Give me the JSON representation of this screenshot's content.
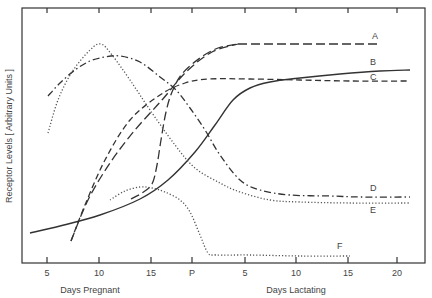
{
  "chart_data": {
    "type": "line",
    "title": "",
    "ylabel": "Receptor  Levels  [ Arbitrary  Units ]",
    "xlabel_segments": [
      {
        "label": "Days  Pregnant",
        "x": 90
      },
      {
        "label": "Days  Lactating",
        "x": 296
      }
    ],
    "x_ticks": [
      {
        "label": "5",
        "px": 47
      },
      {
        "label": "10",
        "px": 99
      },
      {
        "label": "15",
        "px": 151
      },
      {
        "label": "P",
        "px": 192
      },
      {
        "label": "5",
        "px": 245
      },
      {
        "label": "10",
        "px": 296
      },
      {
        "label": "15",
        "px": 348
      },
      {
        "label": "20",
        "px": 397
      }
    ],
    "x_axis_note": "x positions: pregnancy day d -> 47+(d-5)*10.4 ; P (parturition) at 192 ; lactation day d -> 192+d*10.5",
    "ylim": [
      0,
      100
    ],
    "grid": false,
    "legend": "inline labels A-F at right end of curves",
    "series": [
      {
        "name": "A",
        "style": "long-dash",
        "points": [
          [
            7.3,
            -1
          ],
          [
            8,
            10
          ],
          [
            10,
            30
          ],
          [
            12,
            45
          ],
          [
            13,
            50
          ],
          [
            14,
            53
          ],
          [
            15,
            56
          ],
          [
            16,
            64
          ],
          [
            17,
            80
          ],
          [
            18,
            86
          ],
          [
            19,
            89
          ],
          [
            "L2",
            92
          ],
          [
            "L3",
            93
          ],
          [
            "L5",
            93
          ],
          [
            "L10",
            93
          ],
          [
            "L15",
            93
          ],
          [
            "L18",
            93
          ]
        ],
        "pixel_path": [
          [
            71,
            241
          ],
          [
            88,
            200
          ],
          [
            110,
            163
          ],
          [
            135,
            130
          ],
          [
            162,
            100
          ],
          [
            186,
            72
          ],
          [
            212,
            52
          ],
          [
            238,
            44
          ],
          [
            300,
            44
          ],
          [
            380,
            44
          ]
        ],
        "label_pos": [
          372,
          39
        ]
      },
      {
        "name": "B",
        "style": "solid",
        "pixel_path": [
          [
            30,
            233
          ],
          [
            60,
            226
          ],
          [
            100,
            215
          ],
          [
            140,
            199
          ],
          [
            168,
            180
          ],
          [
            195,
            152
          ],
          [
            215,
            125
          ],
          [
            233,
            100
          ],
          [
            250,
            88
          ],
          [
            270,
            82
          ],
          [
            300,
            78
          ],
          [
            340,
            74
          ],
          [
            380,
            71
          ],
          [
            410,
            70
          ]
        ],
        "label_pos": [
          370,
          65
        ]
      },
      {
        "name": "C",
        "style": "dashed",
        "pixel_path": [
          [
            103,
            200
          ],
          [
            113,
            193
          ],
          [
            128,
            187
          ],
          [
            145,
            182
          ],
          [
            152,
            170
          ],
          [
            158,
            150
          ],
          [
            164,
            125
          ],
          [
            170,
            103
          ],
          [
            176,
            88
          ],
          [
            185,
            76
          ],
          [
            200,
            70
          ],
          [
            216,
            66
          ]
        ],
        "pixel_path_2": [
          [
            216,
            79
          ],
          [
            240,
            80
          ],
          [
            270,
            80
          ],
          [
            300,
            80
          ],
          [
            340,
            81
          ],
          [
            380,
            81
          ],
          [
            410,
            81
          ]
        ],
        "label_pos": [
          370,
          80
        ]
      },
      {
        "name": "D",
        "style": "dash-dot",
        "pixel_path": [
          [
            48,
            96
          ],
          [
            60,
            83
          ],
          [
            75,
            70
          ],
          [
            90,
            61
          ],
          [
            105,
            57
          ],
          [
            120,
            56
          ],
          [
            140,
            62
          ],
          [
            160,
            77
          ],
          [
            176,
            90
          ],
          [
            190,
            108
          ],
          [
            205,
            130
          ],
          [
            220,
            155
          ],
          [
            240,
            180
          ],
          [
            260,
            190
          ],
          [
            290,
            195
          ],
          [
            330,
            196
          ],
          [
            360,
            197
          ],
          [
            410,
            197
          ]
        ],
        "label_pos": [
          370,
          191
        ]
      },
      {
        "name": "E",
        "style": "dotted",
        "pixel_path": [
          [
            48,
            133
          ],
          [
            58,
            100
          ],
          [
            72,
            72
          ],
          [
            90,
            50
          ],
          [
            101,
            44
          ],
          [
            112,
            55
          ],
          [
            130,
            80
          ],
          [
            150,
            110
          ],
          [
            175,
            145
          ],
          [
            195,
            168
          ],
          [
            220,
            183
          ],
          [
            240,
            192
          ],
          [
            270,
            200
          ],
          [
            300,
            202
          ],
          [
            350,
            203
          ],
          [
            410,
            203
          ]
        ],
        "label_pos": [
          370,
          213
        ]
      },
      {
        "name": "F",
        "style": "dotted",
        "pixel_path": [
          [
            110,
            200
          ],
          [
            125,
            191
          ],
          [
            140,
            187
          ],
          [
            152,
            188
          ],
          [
            165,
            192
          ],
          [
            180,
            200
          ],
          [
            190,
            212
          ],
          [
            200,
            235
          ],
          [
            208,
            253
          ],
          [
            216,
            255
          ],
          [
            250,
            255
          ],
          [
            300,
            256
          ],
          [
            350,
            256
          ]
        ],
        "label_pos": [
          337,
          249
        ]
      }
    ]
  }
}
